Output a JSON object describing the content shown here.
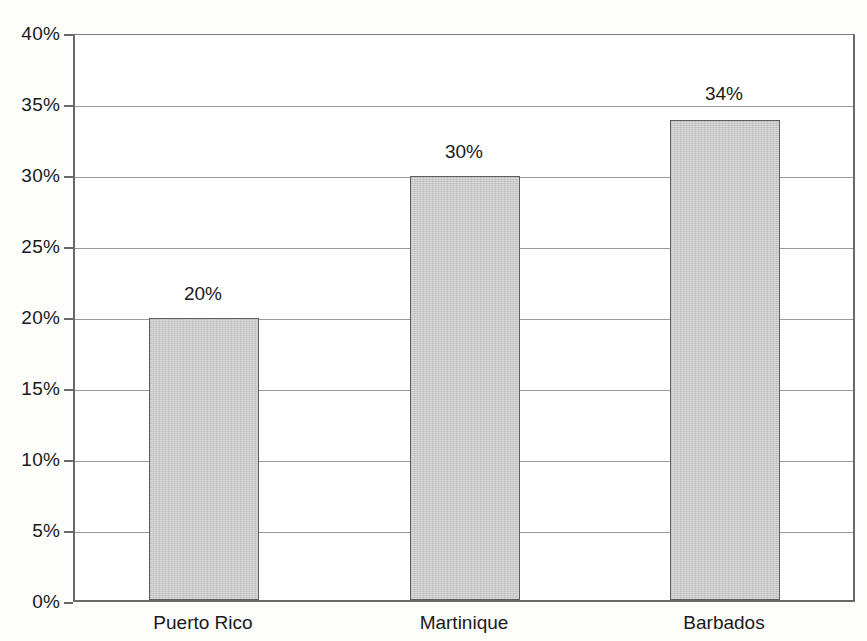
{
  "chart_data": {
    "type": "bar",
    "title": "",
    "subtitle": "",
    "xlabel": "",
    "ylabel": "",
    "categories": [
      "Puerto Rico",
      "Martinique",
      "Barbados"
    ],
    "values": [
      20,
      30,
      34
    ],
    "value_labels": [
      "20%",
      "30%",
      "34%"
    ],
    "ylim": [
      0,
      40
    ],
    "ytick_values": [
      0,
      5,
      10,
      15,
      20,
      25,
      30,
      35,
      40
    ],
    "ytick_labels": [
      "0%",
      "5%",
      "10%",
      "15%",
      "20%",
      "25%",
      "30%",
      "35%",
      "40%"
    ],
    "grid": true,
    "legend": false,
    "legend_position": "none",
    "series": [
      {
        "name": "",
        "values": [
          20,
          30,
          34
        ]
      }
    ],
    "colors": {
      "bar_fill": "#c9c9c9",
      "bar_border": "#5d5d5d",
      "gridline": "#9a9a9a",
      "axis": "#6a6a6a",
      "text": "#1a1a1a",
      "background": "#fdfdfc",
      "plot_background": "#ffffff"
    }
  }
}
